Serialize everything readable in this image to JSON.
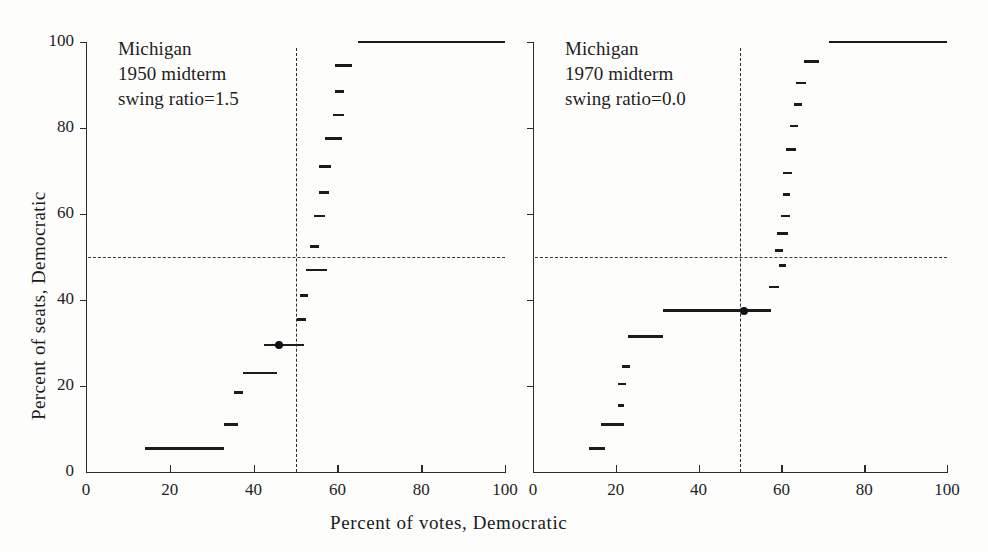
{
  "figure": {
    "xlabel": "Percent  of  votes, Democratic",
    "ylabel": "Percent of seats, Democratic"
  },
  "chart_data": [
    {
      "type": "line",
      "title": "Michigan 1950 midterm",
      "annotation_lines": [
        "Michigan",
        "1950 midterm",
        "swing ratio=1.5"
      ],
      "state": "Michigan",
      "election": "1950 midterm",
      "swing_ratio_label": "swing ratio=1.5",
      "swing_ratio": 1.5,
      "xlabel": "Percent  of  votes, Democratic",
      "ylabel": "Percent of seats, Democratic",
      "xlim": [
        0,
        100
      ],
      "ylim": [
        0,
        100
      ],
      "xticks": [
        0,
        20,
        40,
        60,
        80,
        100
      ],
      "yticks": [
        0,
        20,
        40,
        60,
        80,
        100
      ],
      "grid": false,
      "reference_lines": {
        "vertical_votes": 50,
        "horizontal_seats": 50
      },
      "observed_point": {
        "votes": 46.0,
        "seats": 29.5
      },
      "steps": [
        {
          "x0": 14.0,
          "x1": 33.0,
          "y": 5.5
        },
        {
          "x0": 33.0,
          "x1": 36.3,
          "y": 11.0
        },
        {
          "x0": 35.3,
          "x1": 37.5,
          "y": 18.5
        },
        {
          "x0": 37.5,
          "x1": 45.5,
          "y": 23.0
        },
        {
          "x0": 42.5,
          "x1": 52.0,
          "y": 29.5
        },
        {
          "x0": 50.3,
          "x1": 52.5,
          "y": 35.5
        },
        {
          "x0": 51.0,
          "x1": 53.0,
          "y": 41.0
        },
        {
          "x0": 52.5,
          "x1": 57.5,
          "y": 47.0
        },
        {
          "x0": 53.5,
          "x1": 55.5,
          "y": 52.5
        },
        {
          "x0": 54.5,
          "x1": 57.0,
          "y": 59.5
        },
        {
          "x0": 55.5,
          "x1": 58.0,
          "y": 65.0
        },
        {
          "x0": 55.5,
          "x1": 58.5,
          "y": 71.0
        },
        {
          "x0": 57.0,
          "x1": 61.0,
          "y": 77.5
        },
        {
          "x0": 59.0,
          "x1": 61.5,
          "y": 83.0
        },
        {
          "x0": 59.5,
          "x1": 61.5,
          "y": 88.5
        },
        {
          "x0": 59.5,
          "x1": 63.5,
          "y": 94.5
        },
        {
          "x0": 65.0,
          "x1": 100.0,
          "y": 100.0
        }
      ]
    },
    {
      "type": "line",
      "title": "Michigan 1970 midterm",
      "annotation_lines": [
        "Michigan",
        "1970 midterm",
        "swing ratio=0.0"
      ],
      "state": "Michigan",
      "election": "1970 midterm",
      "swing_ratio_label": "swing ratio=0.0",
      "swing_ratio": 0.0,
      "xlabel": "Percent  of  votes, Democratic",
      "ylabel": "Percent of seats, Democratic",
      "xlim": [
        0,
        100
      ],
      "ylim": [
        0,
        100
      ],
      "xticks": [
        0,
        20,
        40,
        60,
        80,
        100
      ],
      "yticks": [
        0,
        20,
        40,
        60,
        80,
        100
      ],
      "grid": false,
      "reference_lines": {
        "vertical_votes": 50,
        "horizontal_seats": 50
      },
      "observed_point": {
        "votes": 51.0,
        "seats": 37.5
      },
      "steps": [
        {
          "x0": 13.5,
          "x1": 17.5,
          "y": 5.5
        },
        {
          "x0": 16.5,
          "x1": 22.0,
          "y": 11.0
        },
        {
          "x0": 20.5,
          "x1": 22.0,
          "y": 15.5
        },
        {
          "x0": 20.5,
          "x1": 22.5,
          "y": 20.5
        },
        {
          "x0": 21.5,
          "x1": 23.5,
          "y": 24.5
        },
        {
          "x0": 23.0,
          "x1": 31.5,
          "y": 31.5
        },
        {
          "x0": 31.5,
          "x1": 57.5,
          "y": 37.5
        },
        {
          "x0": 57.0,
          "x1": 59.5,
          "y": 43.0
        },
        {
          "x0": 59.5,
          "x1": 61.0,
          "y": 48.0
        },
        {
          "x0": 58.5,
          "x1": 60.5,
          "y": 51.5
        },
        {
          "x0": 59.0,
          "x1": 61.5,
          "y": 55.5
        },
        {
          "x0": 60.0,
          "x1": 62.0,
          "y": 59.5
        },
        {
          "x0": 60.5,
          "x1": 62.0,
          "y": 64.5
        },
        {
          "x0": 60.5,
          "x1": 62.5,
          "y": 69.5
        },
        {
          "x0": 61.0,
          "x1": 63.5,
          "y": 75.0
        },
        {
          "x0": 62.0,
          "x1": 64.0,
          "y": 80.5
        },
        {
          "x0": 63.0,
          "x1": 65.0,
          "y": 85.5
        },
        {
          "x0": 63.5,
          "x1": 66.0,
          "y": 90.5
        },
        {
          "x0": 65.5,
          "x1": 69.0,
          "y": 95.5
        },
        {
          "x0": 71.5,
          "x1": 100.0,
          "y": 100.0
        }
      ]
    }
  ],
  "colors": {
    "ink": "#1b1b1b",
    "axis": "#2b2b2b",
    "dash": "#3a3a3a",
    "background": "#fdfdfc"
  }
}
